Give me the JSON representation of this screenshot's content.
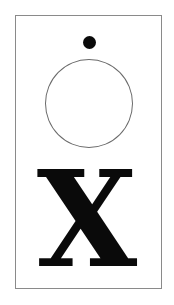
{
  "card": {
    "letter": "X",
    "colors": {
      "border": "#8a8a8a",
      "ink": "#0a0a0a",
      "background": "#ffffff"
    }
  }
}
